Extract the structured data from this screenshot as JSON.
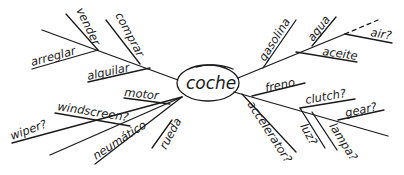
{
  "diagram": {
    "type": "mind-map",
    "center": {
      "label": "coche"
    },
    "left_branches": {
      "upper": {
        "labels": [
          "arreglar",
          "vender",
          "alquilar",
          "comprar"
        ]
      },
      "lower": {
        "labels": [
          "motor",
          "windscreen?",
          "wiper?",
          "neumático",
          "rueda"
        ]
      }
    },
    "right_branches": {
      "upper": {
        "labels": [
          "gasolina",
          "agua",
          "aceite",
          "air?"
        ]
      },
      "lower": {
        "labels": [
          "freno",
          "clutch?",
          "gear?",
          "accelerator?",
          "luz?",
          "lampa?"
        ]
      }
    },
    "colors": {
      "ink": "#1a1a1a",
      "background": "#ffffff"
    }
  }
}
